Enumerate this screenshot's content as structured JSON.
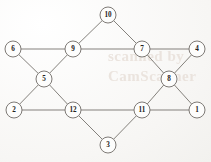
{
  "figure": {
    "kind": "undirected-graph-diagram",
    "background_color": "#fbfbfa",
    "node_fill": "#fdfdfc",
    "node_stroke": "#6f6b66",
    "edge_color": "#6f6b66",
    "label_color": "#242220",
    "node_radius": 8
  },
  "watermark": {
    "line1": "scanned by",
    "line2": "CamScanner"
  },
  "nodes": [
    {
      "id": "10",
      "label": "10",
      "x": 108,
      "y": 15
    },
    {
      "id": "6",
      "label": "6",
      "x": 13,
      "y": 49
    },
    {
      "id": "9",
      "label": "9",
      "x": 73,
      "y": 49
    },
    {
      "id": "7",
      "label": "7",
      "x": 142,
      "y": 49
    },
    {
      "id": "4",
      "label": "4",
      "x": 197,
      "y": 49
    },
    {
      "id": "5",
      "label": "5",
      "x": 44,
      "y": 79
    },
    {
      "id": "8",
      "label": "8",
      "x": 169,
      "y": 79
    },
    {
      "id": "2",
      "label": "2",
      "x": 14,
      "y": 110
    },
    {
      "id": "12",
      "label": "12",
      "x": 73,
      "y": 110
    },
    {
      "id": "11",
      "label": "11",
      "x": 142,
      "y": 110
    },
    {
      "id": "1",
      "label": "1",
      "x": 197,
      "y": 110
    },
    {
      "id": "3",
      "label": "3",
      "x": 108,
      "y": 145
    }
  ],
  "edges": [
    {
      "from": "10",
      "to": "9"
    },
    {
      "from": "10",
      "to": "7"
    },
    {
      "from": "6",
      "to": "9"
    },
    {
      "from": "6",
      "to": "5"
    },
    {
      "from": "9",
      "to": "7"
    },
    {
      "from": "9",
      "to": "5"
    },
    {
      "from": "7",
      "to": "4"
    },
    {
      "from": "7",
      "to": "8"
    },
    {
      "from": "4",
      "to": "8"
    },
    {
      "from": "5",
      "to": "2"
    },
    {
      "from": "5",
      "to": "12"
    },
    {
      "from": "8",
      "to": "11"
    },
    {
      "from": "8",
      "to": "1"
    },
    {
      "from": "2",
      "to": "12"
    },
    {
      "from": "12",
      "to": "11"
    },
    {
      "from": "12",
      "to": "3"
    },
    {
      "from": "11",
      "to": "1"
    },
    {
      "from": "11",
      "to": "3"
    }
  ]
}
